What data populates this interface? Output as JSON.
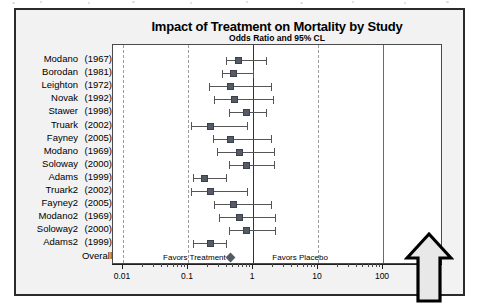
{
  "chart_data": {
    "type": "scatter",
    "subtype": "forest-plot",
    "title": "Impact of Treatment on Mortality by Study",
    "subtitle": "Odds Ratio and 95% CL",
    "xlabel": "",
    "ylabel": "",
    "x_scale": "log10",
    "xlim": [
      0.01,
      100
    ],
    "xticks": [
      "0.01",
      "0.1",
      "1",
      "10",
      "100"
    ],
    "xtick_values": [
      0.01,
      0.1,
      1,
      10,
      100
    ],
    "reference_line": 1,
    "grid": "vertical dashed gridlines at 0.01, 0.1, 10; solid lines at 1 and 100",
    "legend": "none",
    "annotations": [
      {
        "text": "Favors Treatment",
        "x": 0.13,
        "side": "left-of-reference"
      },
      {
        "text": "Favors Placebo",
        "x": 5.5,
        "side": "right-of-reference"
      }
    ],
    "categories": [
      "Modano  (1967)",
      "Borodan (1981)",
      "Leighton (1972)",
      "Novak   (1992)",
      "Stawer  (1998)",
      "Truark  (2002)",
      "Fayney  (2005)",
      "Modano  (1969)",
      "Soloway (2000)",
      "Adams   (1999)",
      "Truark2 (2002)",
      "Fayney2 (2005)",
      "Modano2 (1969)",
      "Soloway2(2000)",
      "Adams2  (1999)",
      "Overall"
    ],
    "series": [
      {
        "name": "Odds Ratio (95% CL)",
        "values": [
          0.6,
          0.5,
          0.45,
          0.52,
          0.8,
          0.22,
          0.45,
          0.62,
          0.8,
          0.18,
          0.22,
          0.5,
          0.62,
          0.8,
          0.22,
          0.45
        ],
        "ci_lower": [
          0.38,
          0.33,
          0.21,
          0.25,
          0.42,
          0.11,
          0.24,
          0.28,
          0.42,
          0.12,
          0.11,
          0.25,
          0.3,
          0.42,
          0.12,
          0.36
        ],
        "ci_upper": [
          1.6,
          1.0,
          1.9,
          2.0,
          1.6,
          0.8,
          1.9,
          2.1,
          2.1,
          0.38,
          0.8,
          1.9,
          2.2,
          2.2,
          0.38,
          0.57
        ]
      }
    ]
  },
  "chart": {
    "title": "Impact of Treatment on Mortality by Study",
    "subtitle": "Odds Ratio and 95% CL",
    "favors_left": "Favors Treatment",
    "favors_right": "Favors Placebo",
    "rows": [
      {
        "name": "Modano",
        "year": "(1967)",
        "or": 0.6,
        "lo": 0.38,
        "hi": 1.6,
        "marker": "square"
      },
      {
        "name": "Borodan",
        "year": "(1981)",
        "or": 0.5,
        "lo": 0.33,
        "hi": 1.0,
        "marker": "square"
      },
      {
        "name": "Leighton",
        "year": "(1972)",
        "or": 0.45,
        "lo": 0.21,
        "hi": 1.9,
        "marker": "square"
      },
      {
        "name": "Novak",
        "year": "(1992)",
        "or": 0.52,
        "lo": 0.25,
        "hi": 2.0,
        "marker": "square"
      },
      {
        "name": "Stawer",
        "year": "(1998)",
        "or": 0.8,
        "lo": 0.42,
        "hi": 1.6,
        "marker": "square"
      },
      {
        "name": "Truark",
        "year": "(2002)",
        "or": 0.22,
        "lo": 0.11,
        "hi": 0.8,
        "marker": "square"
      },
      {
        "name": "Fayney",
        "year": "(2005)",
        "or": 0.45,
        "lo": 0.24,
        "hi": 1.9,
        "marker": "square"
      },
      {
        "name": "Modano",
        "year": "(1969)",
        "or": 0.62,
        "lo": 0.28,
        "hi": 2.1,
        "marker": "square"
      },
      {
        "name": "Soloway",
        "year": "(2000)",
        "or": 0.8,
        "lo": 0.42,
        "hi": 2.1,
        "marker": "square"
      },
      {
        "name": "Adams",
        "year": "(1999)",
        "or": 0.18,
        "lo": 0.12,
        "hi": 0.38,
        "marker": "square"
      },
      {
        "name": "Truark2",
        "year": "(2002)",
        "or": 0.22,
        "lo": 0.11,
        "hi": 0.8,
        "marker": "square"
      },
      {
        "name": "Fayney2",
        "year": "(2005)",
        "or": 0.5,
        "lo": 0.25,
        "hi": 1.9,
        "marker": "square"
      },
      {
        "name": "Modano2",
        "year": "(1969)",
        "or": 0.62,
        "lo": 0.3,
        "hi": 2.2,
        "marker": "square"
      },
      {
        "name": "Soloway2",
        "year": "(2000)",
        "or": 0.8,
        "lo": 0.42,
        "hi": 2.2,
        "marker": "square"
      },
      {
        "name": "Adams2",
        "year": "(1999)",
        "or": 0.22,
        "lo": 0.12,
        "hi": 0.38,
        "marker": "square"
      },
      {
        "name": "Overall",
        "year": "",
        "or": 0.45,
        "lo": 0.36,
        "hi": 0.57,
        "marker": "diamond"
      }
    ],
    "ticks": [
      {
        "label": "0.01",
        "value": 0.01,
        "style": "dashed"
      },
      {
        "label": "0.1",
        "value": 0.1,
        "style": "dashed"
      },
      {
        "label": "1",
        "value": 1,
        "style": "reference"
      },
      {
        "label": "10",
        "value": 10,
        "style": "dashed"
      },
      {
        "label": "100",
        "value": 100,
        "style": "solid"
      }
    ]
  },
  "annotation": {
    "arrow_icon": "up-arrow-icon"
  },
  "colors": {
    "marker": "#555b66",
    "ci_line": "#555555",
    "frame": "#2b2b2b",
    "plot_border": "#4a4a4a",
    "gridline": "#9b9b9b",
    "reference_line": "#333333",
    "figure_background": "#f2f2f2",
    "plot_background": "#ffffff",
    "text": "#000000"
  }
}
